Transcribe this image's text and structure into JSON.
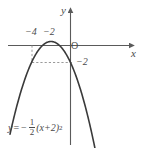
{
  "figure": {
    "background_color": "#ffffff",
    "curve_color": "#3a3a3a",
    "axis_color": "#5a5a5a",
    "dash_color": "#8a8a8a"
  },
  "axes": {
    "x_label": "x",
    "y_label": "y",
    "origin_label": "O"
  },
  "tick_labels": {
    "x_minus4": "−4",
    "x_minus2": "−2",
    "y_minus2": "−2"
  },
  "equation": {
    "lhs": "y",
    "equals": "=",
    "sign": "−",
    "numerator": "1",
    "denominator": "2",
    "body": "(x+2)",
    "exponent": "2",
    "plain": "y = −1/2 (x+2)²"
  },
  "chart_data": {
    "type": "line",
    "title": "",
    "xlabel": "x",
    "ylabel": "y",
    "xlim": [
      -6.2,
      3.2
    ],
    "ylim": [
      -8.5,
      1.6
    ],
    "grid": false,
    "legend": null,
    "function": "y = -1/2 * (x + 2)^2",
    "vertex": [
      -2,
      0
    ],
    "series": [
      {
        "name": "y = -1/2 (x+2)^2",
        "x": [
          -5.4,
          -5.0,
          -4.5,
          -4.0,
          -3.5,
          -3.0,
          -2.5,
          -2.0,
          -1.5,
          -1.0,
          -0.5,
          0.0,
          0.5,
          1.0,
          1.5,
          1.9
        ],
        "y": [
          -5.78,
          -4.5,
          -3.13,
          -2.0,
          -1.13,
          -0.5,
          -0.13,
          0.0,
          -0.13,
          -0.5,
          -1.13,
          -2.0,
          -3.13,
          -4.5,
          -6.13,
          -7.6
        ]
      }
    ],
    "annotations": [
      {
        "text": "−4",
        "x": -4,
        "y": 0,
        "position": "above-axis"
      },
      {
        "text": "−2",
        "x": -2,
        "y": 0,
        "position": "above-axis"
      },
      {
        "text": "−2",
        "x": 0,
        "y": -2,
        "position": "right-of-axis"
      },
      {
        "text": "O",
        "x": 0,
        "y": 0,
        "position": "origin"
      }
    ],
    "guide_lines": [
      {
        "type": "vertical-dashed",
        "x": -4,
        "from_y": 0,
        "to_y": -2
      },
      {
        "type": "horizontal-dashed",
        "y": -2,
        "from_x": -4,
        "to_x": 0
      }
    ]
  }
}
